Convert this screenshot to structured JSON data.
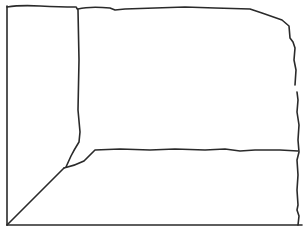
{
  "diagram": {
    "type": "hand-drawn line sketch",
    "stroke_color": "#2a2a2a",
    "background": "#ffffff",
    "regions": [
      {
        "name": "left-tall-region"
      },
      {
        "name": "upper-right-region"
      },
      {
        "name": "lower-right-region"
      },
      {
        "name": "lower-left-triangle-region"
      }
    ]
  }
}
